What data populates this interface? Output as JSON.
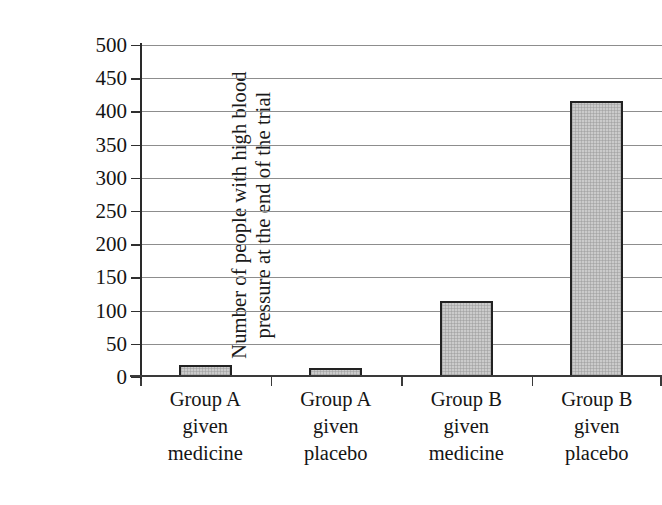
{
  "chart_data": {
    "type": "bar",
    "title": "",
    "subtitle": "",
    "xlabel": "",
    "ylabel": "Number of people with high blood pressure at the end of the trial",
    "ylabel_lines": [
      "Number of people with high blood",
      "pressure at the end of the trial"
    ],
    "categories": [
      "Group A given medicine",
      "Group A given placebo",
      "Group B given medicine",
      "Group B given placebo"
    ],
    "category_lines": [
      [
        "Group A",
        "given",
        "medicine"
      ],
      [
        "Group A",
        "given",
        "placebo"
      ],
      [
        "Group B",
        "given",
        "medicine"
      ],
      [
        "Group B",
        "given",
        "placebo"
      ]
    ],
    "values": [
      18,
      13,
      115,
      415
    ],
    "ylim": [
      0,
      500
    ],
    "ytick_step": 50,
    "ytick_labels": [
      "500",
      "450",
      "400",
      "350",
      "300",
      "250",
      "200",
      "150",
      "100",
      "50",
      "0"
    ],
    "ytick_values": [
      500,
      450,
      400,
      350,
      300,
      250,
      200,
      150,
      100,
      50,
      0
    ],
    "grid": true,
    "legend": false,
    "legend_position": "none",
    "bar_fill_color": "#cbcbcb",
    "bar_edge_color": "#222222",
    "gridline_color": "#8d8d8d",
    "axis_color": "#2a2a2a",
    "background_color": "#ffffff"
  }
}
